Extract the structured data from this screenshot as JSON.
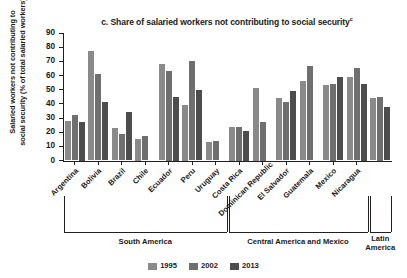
{
  "chart_data": {
    "type": "bar",
    "title": "c. Share of salaried workers not contributing to social security",
    "title_superscript": "c",
    "xlabel": "",
    "ylabel_line1": "Salaried workers not contributing to",
    "ylabel_line2": "social security (% of total salaried workers)",
    "ylim": [
      0,
      90
    ],
    "yticks": [
      0,
      10,
      20,
      30,
      40,
      50,
      60,
      70,
      80,
      90
    ],
    "grid": false,
    "legend_position": "bottom",
    "categories": [
      "Argentina",
      "Bolivia",
      "Brazil",
      "Chile",
      "Ecuador",
      "Peru",
      "Uruguay",
      "Costa Rica",
      "Dominican Republic",
      "El Salvador",
      "Guatemala",
      "Mexico",
      "Nicaragua",
      "Latin America"
    ],
    "series": [
      {
        "name": "1995",
        "color": "#8a8a8a",
        "values": [
          28,
          77,
          23,
          15,
          68,
          39,
          13,
          24,
          51,
          44,
          56,
          53,
          59,
          44
        ]
      },
      {
        "name": "2002",
        "color": "#6f6f6f",
        "values": [
          32,
          61,
          19,
          17,
          63,
          70,
          14,
          24,
          27,
          41,
          67,
          54,
          65,
          45
        ]
      },
      {
        "name": "2013",
        "color": "#4d4d4d",
        "values": [
          27,
          41,
          34,
          null,
          45,
          50,
          null,
          21,
          null,
          49,
          null,
          59,
          54,
          38
        ]
      }
    ],
    "regions": [
      {
        "label": "South America",
        "start_index": 0,
        "end_index": 6
      },
      {
        "label": "Central America and Mexico",
        "start_index": 7,
        "end_index": 12
      },
      {
        "label_line1": "Latin",
        "label_line2": "America",
        "start_index": 13,
        "end_index": 13
      }
    ],
    "legend": [
      {
        "label": "1995",
        "color": "#8a8a8a"
      },
      {
        "label": "2002",
        "color": "#6f6f6f"
      },
      {
        "label": "2013",
        "color": "#4d4d4d"
      }
    ]
  }
}
